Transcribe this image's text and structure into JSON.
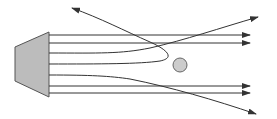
{
  "diagram": {
    "type": "ray/particle scattering schematic",
    "colors": {
      "background": "#ffffff",
      "line": "#333333",
      "source_fill": "#bcbcbc",
      "source_stroke": "#555555",
      "target_fill": "#cccccc",
      "target_stroke": "#666666"
    },
    "source": {
      "shape": "trapezoid",
      "points": [
        [
          15,
          47
        ],
        [
          49,
          32
        ],
        [
          49,
          97
        ],
        [
          15,
          81
        ]
      ]
    },
    "target": {
      "shape": "circle",
      "cx": 180,
      "cy": 65,
      "r": 7
    },
    "rays": [
      {
        "id": "ray-1",
        "kind": "straight",
        "path": "M49,35 L250,35",
        "deflection": "none"
      },
      {
        "id": "ray-2",
        "kind": "straight",
        "path": "M49,43 L250,43",
        "deflection": "none"
      },
      {
        "id": "ray-3",
        "kind": "deflected-up",
        "path": "M49,53 C100,53 120,54 150,48 C185,40 220,28 258,17",
        "deflection": "small upward"
      },
      {
        "id": "ray-4",
        "kind": "backscattered",
        "path": "M49,64 C100,64 140,64 160,61 C175,58 168,50 150,42 C125,31 100,18 72,8",
        "deflection": "large backward"
      },
      {
        "id": "ray-5",
        "kind": "deflected-down",
        "path": "M49,75 C90,75 110,76 130,79 C170,87 215,100 256,114",
        "deflection": "small downward"
      },
      {
        "id": "ray-6",
        "kind": "straight",
        "path": "M49,86 L250,86",
        "deflection": "none"
      },
      {
        "id": "ray-7",
        "kind": "straight",
        "path": "M49,93 L250,93",
        "deflection": "none"
      }
    ]
  }
}
